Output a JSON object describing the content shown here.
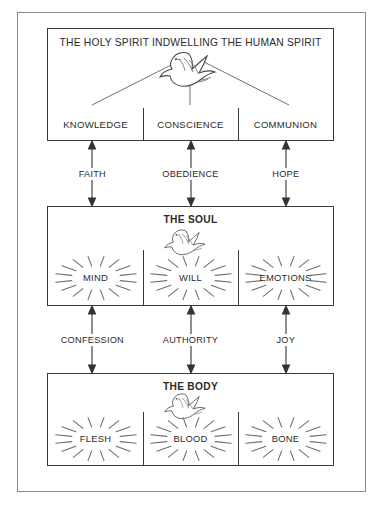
{
  "diagram": {
    "title": "THE HOLY SPIRIT INDWELLING THE HUMAN SPIRIT",
    "colors": {
      "frame": "#8a8a8a",
      "panel_border": "#3a3a3a",
      "text": "#2b2b2b",
      "burst": "#6e6e6e",
      "arrow": "#333333",
      "background": "#ffffff"
    },
    "panels": [
      {
        "id": "spirit",
        "title": "THE HOLY SPIRIT INDWELLING THE HUMAN SPIRIT",
        "title_bold": false,
        "icon": "dove-icon",
        "has_burst": false,
        "cells": [
          {
            "label": "KNOWLEDGE"
          },
          {
            "label": "CONSCIENCE"
          },
          {
            "label": "COMMUNION"
          }
        ]
      },
      {
        "id": "soul",
        "title": "THE SOUL",
        "title_bold": true,
        "icon": "dove-icon",
        "has_burst": true,
        "cells": [
          {
            "label": "MIND"
          },
          {
            "label": "WILL"
          },
          {
            "label": "EMOTIONS"
          }
        ]
      },
      {
        "id": "body",
        "title": "THE BODY",
        "title_bold": true,
        "icon": "dove-icon",
        "has_burst": true,
        "cells": [
          {
            "label": "FLESH"
          },
          {
            "label": "BLOOD"
          },
          {
            "label": "BONE"
          }
        ]
      }
    ],
    "connectors": [
      {
        "id": "spirit-to-soul",
        "from": "spirit",
        "to": "soul",
        "direction": "both",
        "labels": [
          {
            "label": "FAITH"
          },
          {
            "label": "OBEDIENCE"
          },
          {
            "label": "HOPE"
          }
        ]
      },
      {
        "id": "soul-to-body",
        "from": "soul",
        "to": "body",
        "direction": "both",
        "labels": [
          {
            "label": "CONFESSION"
          },
          {
            "label": "AUTHORITY"
          },
          {
            "label": "JOY"
          }
        ]
      }
    ]
  }
}
